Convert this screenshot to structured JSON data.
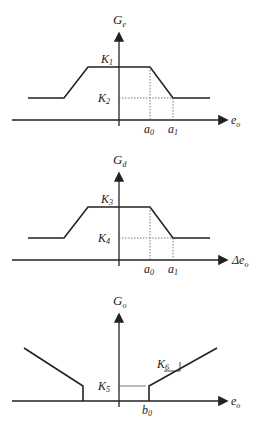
{
  "charts": [
    {
      "ylabel": "G",
      "ylabel_sub": "e",
      "xlabel": "e",
      "xlabel_sub": "o",
      "levels": [
        {
          "name": "K",
          "sub": "1"
        },
        {
          "name": "K",
          "sub": "2"
        }
      ],
      "ticks": [
        {
          "name": "a",
          "sub": "0"
        },
        {
          "name": "a",
          "sub": "1"
        }
      ]
    },
    {
      "ylabel": "G",
      "ylabel_sub": "d",
      "xlabel": "Δe",
      "xlabel_sub": "o",
      "levels": [
        {
          "name": "K",
          "sub": "3"
        },
        {
          "name": "K",
          "sub": "4"
        }
      ],
      "ticks": [
        {
          "name": "a",
          "sub": "0"
        },
        {
          "name": "a",
          "sub": "1"
        }
      ]
    },
    {
      "ylabel": "G",
      "ylabel_sub": "o",
      "xlabel": "e",
      "xlabel_sub": "o",
      "levels": [
        {
          "name": "K",
          "sub": "5"
        }
      ],
      "slope_label": {
        "name": "K",
        "sub": "6"
      },
      "ticks": [
        {
          "name": "b",
          "sub": "0"
        }
      ]
    }
  ],
  "colors": {
    "line": "#222222",
    "dotted": "#555555",
    "background": "#ffffff"
  }
}
